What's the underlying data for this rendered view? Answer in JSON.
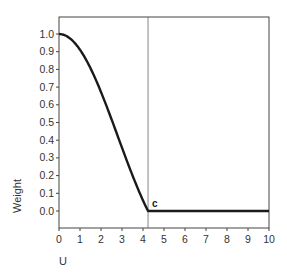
{
  "chart_data": {
    "type": "line",
    "title": "",
    "xlabel": "U",
    "ylabel": "Weight",
    "xlim": [
      0,
      10
    ],
    "ylim": [
      -0.1,
      1.1
    ],
    "x_ticks": [
      0,
      1,
      2,
      3,
      4,
      5,
      6,
      7,
      8,
      9,
      10
    ],
    "x_tick_labels": [
      "0",
      "1",
      "2",
      "3",
      "4",
      "5",
      "6",
      "7",
      "8",
      "9",
      "10"
    ],
    "y_ticks": [
      0.0,
      0.1,
      0.2,
      0.3,
      0.4,
      0.5,
      0.6,
      0.7,
      0.8,
      0.9,
      1.0
    ],
    "y_tick_labels": [
      "0.0",
      "0.1",
      "0.2",
      "0.3",
      "0.4",
      "0.5",
      "0.6",
      "0.7",
      "0.8",
      "0.9",
      "1.0"
    ],
    "grid": false,
    "legend": null,
    "series": [
      {
        "name": "weight function",
        "x": [
          0,
          0.5,
          1,
          1.5,
          2,
          2.5,
          3,
          3.5,
          4,
          4.24,
          5,
          6,
          7,
          8,
          9,
          10
        ],
        "values": [
          1.0,
          0.98,
          0.91,
          0.81,
          0.67,
          0.52,
          0.36,
          0.2,
          0.05,
          0.0,
          0.0,
          0.0,
          0.0,
          0.0,
          0.0,
          0.0
        ]
      }
    ],
    "annotations": [
      {
        "text": "c",
        "x": 4.24,
        "y": 0.0,
        "vertical_line_x": 4.24
      }
    ]
  }
}
